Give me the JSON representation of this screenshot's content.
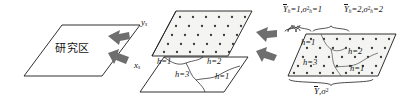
{
  "diagram": {
    "title_region": "研究区",
    "axes": {
      "y_label": "y",
      "y_sub": "s",
      "x_label": "x",
      "x_sub": "s"
    },
    "middle_plane_strata": [
      {
        "label": "h",
        "value": "1"
      },
      {
        "label": "h",
        "value": "2"
      },
      {
        "label": "h",
        "value": "3"
      },
      {
        "label": "h",
        "value": "1"
      }
    ],
    "right_plane_strata": [
      {
        "label": "h",
        "value": "1"
      },
      {
        "label": "h",
        "value": "2"
      },
      {
        "label": "h",
        "value": "3"
      },
      {
        "label": "h",
        "value": "1"
      }
    ],
    "top_stats": [
      {
        "mean_sym": "Y",
        "mean_sub": "h",
        "mean_val": "1",
        "var_sym": "σ",
        "var_sup": "2",
        "var_sub": "h",
        "var_val": "1"
      },
      {
        "mean_sym": "Y",
        "mean_sub": "h",
        "mean_val": "2",
        "var_sym": "σ",
        "var_sup": "2",
        "var_sub": "h",
        "var_val": "2"
      }
    ],
    "bottom_stat": {
      "mean_sym": "Y",
      "var_sym": "σ",
      "var_sup": "2",
      "separator": ","
    },
    "arrows": [
      {
        "name": "arrow-study-to-grid"
      },
      {
        "name": "arrow-study-to-strata"
      },
      {
        "name": "arrow-grid-to-result"
      },
      {
        "name": "arrow-strata-to-result"
      }
    ],
    "colors": {
      "line": "#1a1a1a",
      "plane_fill": "#f4f4f2",
      "dot": "#3a3a3a",
      "arrow": "#6e6e6e",
      "brace": "#2b2b2b"
    }
  }
}
